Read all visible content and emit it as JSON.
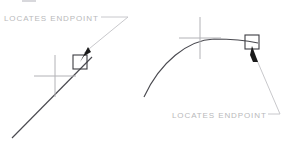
{
  "figure": {
    "title": "",
    "background_color": "#ffffff",
    "geometry_color": "#4a4a50",
    "crosshair_color": "#b2b2b6",
    "label_color": "#b9b9bb",
    "marker_color": "#3c3c42",
    "cursor_color": "#1a1a1a",
    "leader_color": "#c2c2c6"
  },
  "panels": [
    {
      "id": "line-endpoint",
      "entity_type": "line",
      "label": "LOCATES  ENDPOINT",
      "label_position": {
        "x": 4,
        "y": 21
      },
      "snap_marker": "square",
      "snap_marker_position": {
        "x": 80,
        "y": 62
      },
      "crosshair_center": {
        "x": 55,
        "y": 76
      },
      "geometry_start": {
        "x": 12,
        "y": 138
      },
      "geometry_end": {
        "x": 92,
        "y": 57
      },
      "cursor_tip": {
        "x": 80,
        "y": 62
      },
      "leader_points": "101,17 128,17 84,53"
    },
    {
      "id": "arc-endpoint",
      "entity_type": "arc",
      "label": "LOCATES  ENDPOINT",
      "label_position": {
        "x": 172,
        "y": 118
      },
      "snap_marker": "square",
      "snap_marker_position": {
        "x": 252,
        "y": 42
      },
      "crosshair_center": {
        "x": 200,
        "y": 38
      },
      "geometry_start": {
        "x": 144,
        "y": 97
      },
      "geometry_apex": {
        "x": 212,
        "y": 39
      },
      "geometry_end": {
        "x": 258,
        "y": 43
      },
      "cursor_tip": {
        "x": 252,
        "y": 46
      },
      "leader_points": "268,114 280,114 256,58"
    }
  ],
  "crosshair": {
    "horizontal_half_length": 21,
    "vertical_half_length": 21,
    "right_horizontal_half_length": 21,
    "right_vertical_half_length": 21
  },
  "snap_square": {
    "size": 14,
    "stroke_width": 1.1
  },
  "icons": {
    "snap_marker": "endpoint-square-icon",
    "pointer": "arrow-cursor-icon",
    "crosshair": "crosshair-icon"
  }
}
